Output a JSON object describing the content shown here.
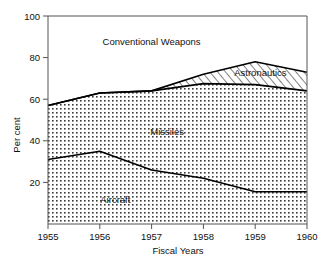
{
  "chart_data": {
    "type": "area",
    "title": "",
    "xlabel": "Fiscal Years",
    "ylabel": "Per cent",
    "x": [
      1955,
      1956,
      1957,
      1958,
      1959,
      1960
    ],
    "xtick_labels": [
      "1955",
      "1956",
      "1957",
      "1958",
      "1959",
      "1960"
    ],
    "ytick_labels": [
      "20",
      "40",
      "60",
      "80",
      "100"
    ],
    "yticks": [
      20,
      40,
      60,
      80,
      100
    ],
    "ylim": [
      0,
      100
    ],
    "xlim": [
      1955,
      1960
    ],
    "grid": false,
    "legend": "inline-labels",
    "stacked": true,
    "series": [
      {
        "name": "Aircraft",
        "fill": "dotted",
        "values": [
          31,
          35,
          26,
          22,
          15.5,
          15.5
        ],
        "cumulative_top": [
          31,
          35,
          26,
          22,
          15.5,
          15.5
        ]
      },
      {
        "name": "Missiles",
        "fill": "dotted",
        "values": [
          26,
          28,
          38,
          45.5,
          51.5,
          48.5
        ],
        "cumulative_top": [
          57,
          63,
          64,
          67.5,
          67,
          64
        ]
      },
      {
        "name": "Astronautics",
        "fill": "diagonal-hatch",
        "values": [
          0,
          0,
          0,
          4.5,
          11,
          9
        ],
        "cumulative_top": [
          57,
          63,
          64,
          72,
          78,
          73
        ]
      },
      {
        "name": "Conventional Weapons",
        "fill": "none",
        "values": [
          43,
          37,
          36,
          28,
          22,
          27
        ],
        "cumulative_top": [
          100,
          100,
          100,
          100,
          100,
          100
        ]
      }
    ],
    "annotations": [
      {
        "text": "Conventional Weapons",
        "x": 1957.0,
        "y": 86
      },
      {
        "text": "Astronautics",
        "x": 1959.1,
        "y": 71
      },
      {
        "text": "Missiles",
        "x": 1957.3,
        "y": 43
      },
      {
        "text": "Aircraft",
        "x": 1956.3,
        "y": 10
      }
    ],
    "colors": {
      "axis": "#555555",
      "line": "#000000",
      "text": "#111111",
      "background": "#ffffff"
    }
  }
}
